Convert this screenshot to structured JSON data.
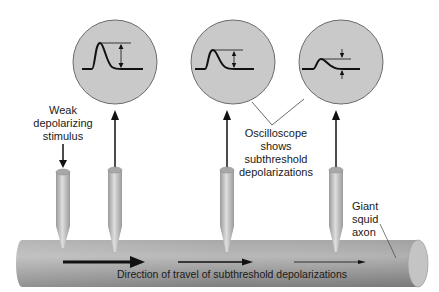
{
  "diagram": {
    "type": "neuroscience illustration: subthreshold depolarization recording along giant squid axon",
    "colors": {
      "scope_fill": "#c9c9c9",
      "scope_stroke": "#6b6b6b",
      "axon_light": "#bdbdbd",
      "axon_dark": "#8a8a8a",
      "electrode": "#c2c2c2",
      "ink": "#111111"
    },
    "labels": {
      "stimulus": [
        "Weak",
        "depolarizing",
        "stimulus"
      ],
      "oscilloscope": [
        "Oscilloscope",
        "shows",
        "subthreshold",
        "depolarizations"
      ],
      "axon": [
        "Giant",
        "squid",
        "axon"
      ],
      "direction": "Direction of travel of subthreshold depolarizations"
    },
    "oscilloscopes": [
      {
        "id": "scope-1",
        "cx": 115,
        "cy": 62,
        "r": 42,
        "amplitude": "large"
      },
      {
        "id": "scope-2",
        "cx": 233,
        "cy": 62,
        "r": 42,
        "amplitude": "medium"
      },
      {
        "id": "scope-3",
        "cx": 341,
        "cy": 62,
        "r": 42,
        "amplitude": "small"
      }
    ],
    "electrodes": [
      {
        "id": "stimulating-electrode",
        "x": 63,
        "role": "stimulus"
      },
      {
        "id": "recording-electrode-1",
        "x": 115,
        "role": "recording"
      },
      {
        "id": "recording-electrode-2",
        "x": 227,
        "role": "recording"
      },
      {
        "id": "recording-electrode-3",
        "x": 336,
        "role": "recording"
      }
    ]
  }
}
